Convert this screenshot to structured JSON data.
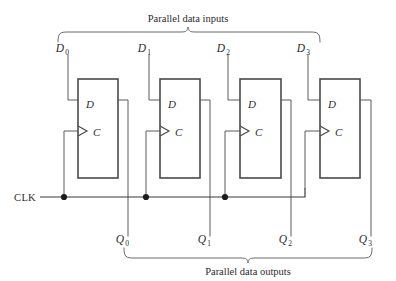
{
  "figure": {
    "kind": "logic-diagram",
    "top_caption": "Parallel data inputs",
    "bottom_caption": "Parallel data outputs",
    "clock_label": "CLK",
    "colors": {
      "wire": "#5a5a5a",
      "box_outline": "#4a4a4a",
      "bus": "#3b3b3b",
      "brace": "#6b6b6b",
      "junction_dot": "#1c1c1c",
      "text": "#2b2b2b",
      "background": "#ffffff"
    }
  },
  "inputs": [
    {
      "base": "D",
      "sub": "0"
    },
    {
      "base": "D",
      "sub": "1"
    },
    {
      "base": "D",
      "sub": "2"
    },
    {
      "base": "D",
      "sub": "3"
    }
  ],
  "outputs": [
    {
      "base": "Q",
      "sub": "0"
    },
    {
      "base": "Q",
      "sub": "1"
    },
    {
      "base": "Q",
      "sub": "2"
    },
    {
      "base": "Q",
      "sub": "3"
    }
  ],
  "flipflops": [
    {
      "index": 0,
      "data_port": "D",
      "clock_port": "C"
    },
    {
      "index": 1,
      "data_port": "D",
      "clock_port": "C"
    },
    {
      "index": 2,
      "data_port": "D",
      "clock_port": "C"
    },
    {
      "index": 3,
      "data_port": "D",
      "clock_port": "C"
    }
  ]
}
